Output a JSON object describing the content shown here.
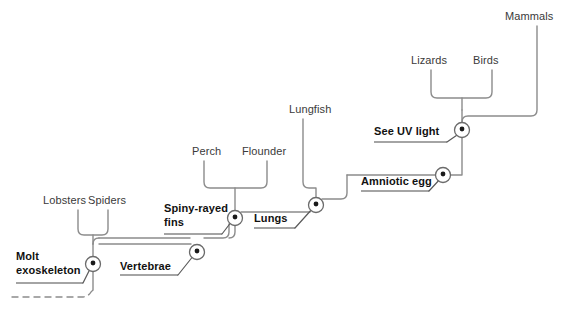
{
  "diagram": {
    "type": "cladogram",
    "title": "",
    "line_color": "#8c8c8c",
    "node_stroke_color": "#6b6b6b",
    "taxon_text_color": "#3a3a3a",
    "trait_text_color": "#111111"
  },
  "taxa": [
    {
      "id": "lobsters",
      "label": "Lobsters",
      "x": 70,
      "y": 202
    },
    {
      "id": "spiders",
      "label": "Spiders",
      "x": 106,
      "y": 202
    },
    {
      "id": "perch",
      "label": "Perch",
      "x": 194,
      "y": 153
    },
    {
      "id": "flounder",
      "label": "Flounder",
      "x": 243,
      "y": 153
    },
    {
      "id": "lungfish",
      "label": "Lungfish",
      "x": 292,
      "y": 111
    },
    {
      "id": "lizards",
      "label": "Lizards",
      "x": 415,
      "y": 62
    },
    {
      "id": "birds",
      "label": "Birds",
      "x": 476,
      "y": 62
    },
    {
      "id": "mammals",
      "label": "Mammals",
      "x": 505,
      "y": 18
    }
  ],
  "traits": [
    {
      "id": "molt-exoskeleton",
      "label_line1": "Molt",
      "label_line2": "exoskeleton",
      "x": 16,
      "y": 251,
      "underline_x1": 16,
      "underline_x2": 83,
      "underline_y": 283,
      "node_x": 93,
      "node_y": 264
    },
    {
      "id": "vertebrae",
      "label_line1": "Vertebrae",
      "label_line2": "",
      "x": 120,
      "y": 260,
      "underline_x1": 120,
      "underline_x2": 178,
      "underline_y": 275,
      "node_x": 197,
      "node_y": 252
    },
    {
      "id": "spiny-rayed-fins",
      "label_line1": "Spiny-rayed",
      "label_line2": "fins",
      "x": 164,
      "y": 203,
      "underline_x1": 164,
      "underline_x2": 222,
      "underline_y": 234,
      "node_x": 235,
      "node_y": 218
    },
    {
      "id": "lungs",
      "label_line1": "Lungs",
      "label_line2": "",
      "x": 254,
      "y": 212,
      "underline_x1": 254,
      "underline_x2": 295,
      "underline_y": 228,
      "node_x": 316,
      "node_y": 205
    },
    {
      "id": "amniotic-egg",
      "label_line1": "Amniotic egg",
      "label_line2": "",
      "x": 361,
      "y": 175,
      "underline_x1": 361,
      "underline_x2": 429,
      "underline_y": 191,
      "node_x": 443,
      "node_y": 175
    },
    {
      "id": "see-uv-light",
      "label_line1": "See UV light",
      "label_line2": "",
      "x": 374,
      "y": 124,
      "underline_x1": 374,
      "underline_x2": 447,
      "underline_y": 142,
      "node_x": 462,
      "node_y": 130
    }
  ],
  "root": {
    "id": "root-dashed-branch",
    "label": "",
    "dash_x1": 12,
    "dash_x2": 88,
    "dash_y": 297
  },
  "nodes": [
    {
      "id": "node-molt",
      "cx": 93,
      "cy": 264
    },
    {
      "id": "node-vertebrae",
      "cx": 197,
      "cy": 252
    },
    {
      "id": "node-spiny",
      "cx": 235,
      "cy": 218
    },
    {
      "id": "node-lungs",
      "cx": 316,
      "cy": 205
    },
    {
      "id": "node-amniotic",
      "cx": 443,
      "cy": 175
    },
    {
      "id": "node-uv",
      "cx": 462,
      "cy": 130
    }
  ]
}
